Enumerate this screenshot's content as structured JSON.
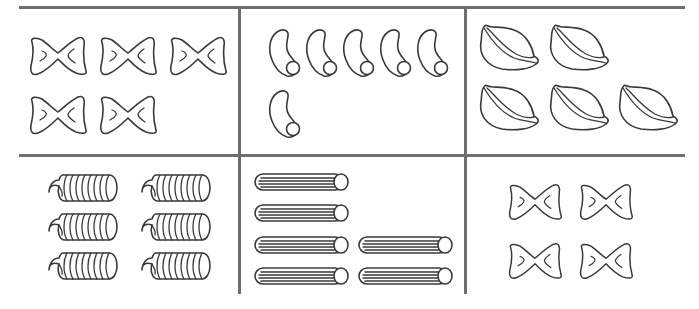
{
  "figure": {
    "line_color": "#6e6e6e",
    "stroke_color": "#3a3a3a",
    "cells": [
      {
        "id": "cell-1",
        "pasta": "bow-tie",
        "count": 5,
        "rows": [
          3,
          2
        ]
      },
      {
        "id": "cell-2",
        "pasta": "macaroni",
        "count": 6,
        "rows": [
          5,
          1
        ]
      },
      {
        "id": "cell-3",
        "pasta": "shell",
        "count": 5,
        "rows": [
          2,
          3
        ]
      },
      {
        "id": "cell-4",
        "pasta": "fusilli",
        "count": 6,
        "rows": [
          2,
          2,
          2
        ]
      },
      {
        "id": "cell-5",
        "pasta": "penne",
        "count": 6,
        "rows": [
          1,
          1,
          2,
          2
        ]
      },
      {
        "id": "cell-6",
        "pasta": "bow-tie",
        "count": 4,
        "rows": [
          2,
          2
        ]
      }
    ]
  }
}
